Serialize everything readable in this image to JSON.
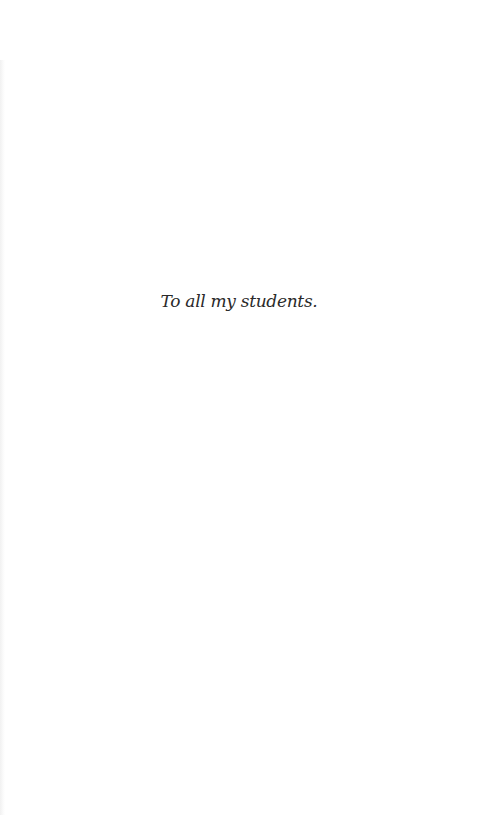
{
  "page": {
    "dedication": "To all my students."
  }
}
